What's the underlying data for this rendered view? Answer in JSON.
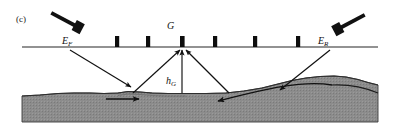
{
  "figure": {
    "panel_label": "(c)",
    "labels": {
      "transmitter": "E",
      "transmitter_sub": "F",
      "receiver": "E",
      "receiver_sub": "R",
      "scatter_point": "G",
      "height": "h",
      "height_sub": "G"
    },
    "colors": {
      "background": "#ffffff",
      "surface_line": "#6e6e6e",
      "ground_fill": "#8c8c8c",
      "ground_outline": "#3a3a3a",
      "ink": "#111111",
      "marker": "#0d0d0d",
      "leader_line": "#4a4a4a"
    },
    "surface": {
      "y": 47,
      "x_start": 22,
      "x_end": 378,
      "marker_count": 6,
      "marker_positions": [
        117,
        148,
        192,
        243,
        290,
        182
      ],
      "marker_width": 4,
      "marker_height": 11
    },
    "antennas": [
      {
        "name": "forward-antenna",
        "label_key": "transmitter",
        "x": 75,
        "y": 28
      },
      {
        "name": "reverse-antenna",
        "label_key": "receiver",
        "x": 342,
        "y": 28
      }
    ],
    "rays": [
      {
        "name": "incident-ray-left",
        "from": [
          72,
          52
        ],
        "to": [
          133,
          88
        ]
      },
      {
        "name": "scattered-ray-left",
        "from": [
          133,
          90
        ],
        "to": [
          181,
          51
        ]
      },
      {
        "name": "vertical-height-ray",
        "from": [
          182,
          90
        ],
        "to": [
          182,
          51
        ]
      },
      {
        "name": "scattered-ray-right",
        "from": [
          228,
          90
        ],
        "to": [
          187,
          51
        ]
      },
      {
        "name": "incident-ray-right",
        "from": [
          330,
          52
        ],
        "to": [
          277,
          94
        ]
      }
    ],
    "subsurface_flow": [
      {
        "name": "flow-arrow-left",
        "from": [
          108,
          97
        ],
        "to": [
          142,
          97
        ]
      },
      {
        "name": "flow-arrow-right",
        "from": [
          330,
          92
        ],
        "to": [
          215,
          99
        ]
      }
    ]
  }
}
